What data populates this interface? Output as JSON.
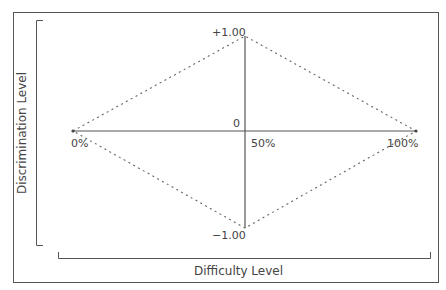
{
  "diagram": {
    "x_axis_label": "Difficulty Level",
    "y_axis_label": "Discrimination Level",
    "labels": {
      "top": "+1.00",
      "origin": "0",
      "bottom": "−1.00",
      "left": "0%",
      "middle": "50%",
      "right": "100%"
    },
    "shape": "diamond",
    "vertices": [
      {
        "difficulty": "0%",
        "discrimination": 0
      },
      {
        "difficulty": "50%",
        "discrimination": 1.0
      },
      {
        "difficulty": "100%",
        "discrimination": 0
      },
      {
        "difficulty": "50%",
        "discrimination": -1.0
      }
    ],
    "colors": {
      "line": "#555555",
      "dotted": "#666666"
    }
  }
}
